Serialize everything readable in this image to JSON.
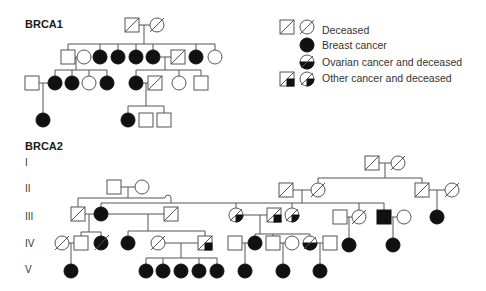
{
  "brca1": {
    "title": "BRCA1"
  },
  "brca2": {
    "title": "BRCA2",
    "generations": [
      "I",
      "II",
      "III",
      "IV",
      "V"
    ]
  },
  "legend": {
    "items": [
      {
        "symbols": [
          "square-deceased",
          "circle-deceased"
        ],
        "label": "Deceased"
      },
      {
        "symbols": [
          "circle-filled"
        ],
        "label": "Breast cancer"
      },
      {
        "symbols": [
          "circle-ovarian-deceased"
        ],
        "label": "Ovarian cancer and deceased"
      },
      {
        "symbols": [
          "square-other-deceased",
          "circle-other-deceased"
        ],
        "label": "Other  cancer and deceased"
      }
    ]
  },
  "colors": {
    "line": "#555555",
    "fill": "#111111",
    "background": "#ffffff"
  }
}
